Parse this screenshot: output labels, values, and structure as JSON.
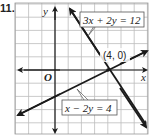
{
  "problem_number": "11.",
  "graph": {
    "x_axis_label": "x",
    "y_axis_label": "y",
    "origin_label": "O",
    "grid": {
      "x_min": -3,
      "x_max": 7,
      "y_min": -5,
      "y_max": 5,
      "step": 1
    },
    "lines": [
      {
        "equation": "3x + 2y = 12",
        "color": "#1a1a1a"
      },
      {
        "equation": "x − 2y = 4",
        "color": "#1a1a1a"
      }
    ],
    "intersection": {
      "label": "(4, 0)",
      "x": 4,
      "y": 0
    }
  },
  "colors": {
    "grid": "#b8b8b8",
    "axis": "#1a1a1a",
    "line": "#1a1a1a",
    "box_border": "#555555"
  }
}
